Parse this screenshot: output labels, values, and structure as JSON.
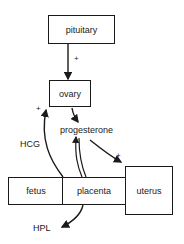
{
  "diagram": {
    "top_cut_text": "",
    "nodes": {
      "pituitary": "pituitary",
      "ovary": "ovary",
      "fetus": "fetus",
      "placenta": "placenta",
      "uterus": "uterus"
    },
    "labels": {
      "progesterone": "progesterone",
      "hcg": "HCG",
      "hpl": "HPL"
    },
    "signs": {
      "pituitary_to_ovary": "+",
      "hcg_to_ovary": "+",
      "progesterone_to_uterus": "+"
    },
    "edges": [
      {
        "from": "pituitary",
        "to": "ovary",
        "sign": "+"
      },
      {
        "from": "placenta",
        "to": "ovary",
        "label": "HCG",
        "sign": "+"
      },
      {
        "from": "ovary",
        "to": "progesterone"
      },
      {
        "from": "placenta",
        "to": "progesterone",
        "style": "double"
      },
      {
        "from": "progesterone",
        "to": "uterus",
        "sign": "+"
      },
      {
        "from": "placenta",
        "to": "HPL"
      }
    ],
    "line_color": "#1a1a1a"
  }
}
